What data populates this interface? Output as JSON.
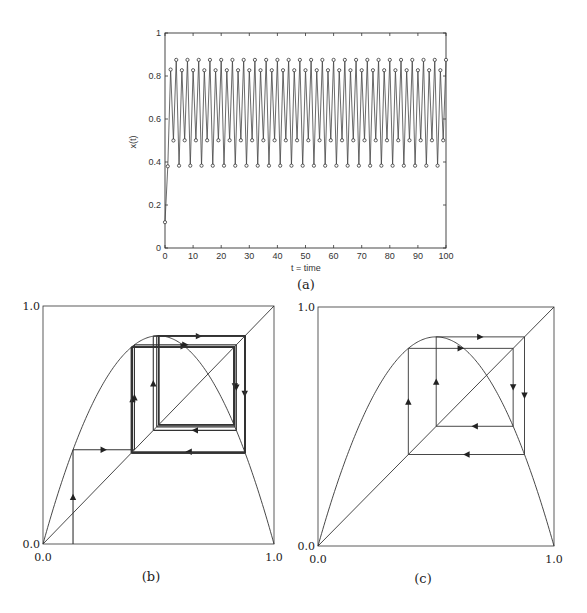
{
  "figure": {
    "captions": {
      "a": "(a)",
      "b": "(b)",
      "c": "(c)"
    }
  },
  "chart_data": [
    {
      "id": "a",
      "type": "line",
      "title": "",
      "xlabel": "t = time",
      "ylabel": "x(t)",
      "xlim": [
        0,
        100
      ],
      "ylim": [
        0,
        1
      ],
      "xticks": [
        0,
        10,
        20,
        30,
        40,
        50,
        60,
        70,
        80,
        90,
        100
      ],
      "yticks": [
        0,
        0.2,
        0.4,
        0.6,
        0.8,
        1
      ],
      "xtick_labels": [
        "0",
        "10",
        "20",
        "30",
        "40",
        "50",
        "60",
        "70",
        "80",
        "90",
        "100"
      ],
      "ytick_labels": [
        "0",
        "0.2",
        "0.4",
        "0.6",
        "0.8",
        "1"
      ],
      "grid": false,
      "markers": "circle",
      "series": [
        {
          "name": "x(t)",
          "initial": [
            0.12,
            0.38,
            0.83,
            0.5
          ],
          "cycle": [
            0.875,
            0.3828,
            0.8269,
            0.5009
          ],
          "note": "period-4 oscillation from t=4 to t=100"
        }
      ]
    },
    {
      "id": "b",
      "type": "line",
      "title": "",
      "description": "Cobweb diagram of logistic map with transient converging to period-4 cycle",
      "xlim": [
        0,
        1
      ],
      "ylim": [
        0,
        1
      ],
      "xtick_labels": [
        "0.0",
        "1.0"
      ],
      "ytick_labels": [
        "0.0",
        "1.0"
      ],
      "r": 3.5,
      "x0": 0.13,
      "cycle": [
        0.875,
        0.3828,
        0.8269,
        0.5009
      ]
    },
    {
      "id": "c",
      "type": "line",
      "title": "",
      "description": "Cobweb diagram showing the period-4 cycle of the logistic map",
      "xlim": [
        0,
        1
      ],
      "ylim": [
        0,
        1
      ],
      "xtick_labels": [
        "0.0",
        "1.0"
      ],
      "ytick_labels": [
        "0.0",
        "1.0"
      ],
      "r": 3.5,
      "cycle": [
        0.875,
        0.3828,
        0.8269,
        0.5009
      ]
    }
  ]
}
